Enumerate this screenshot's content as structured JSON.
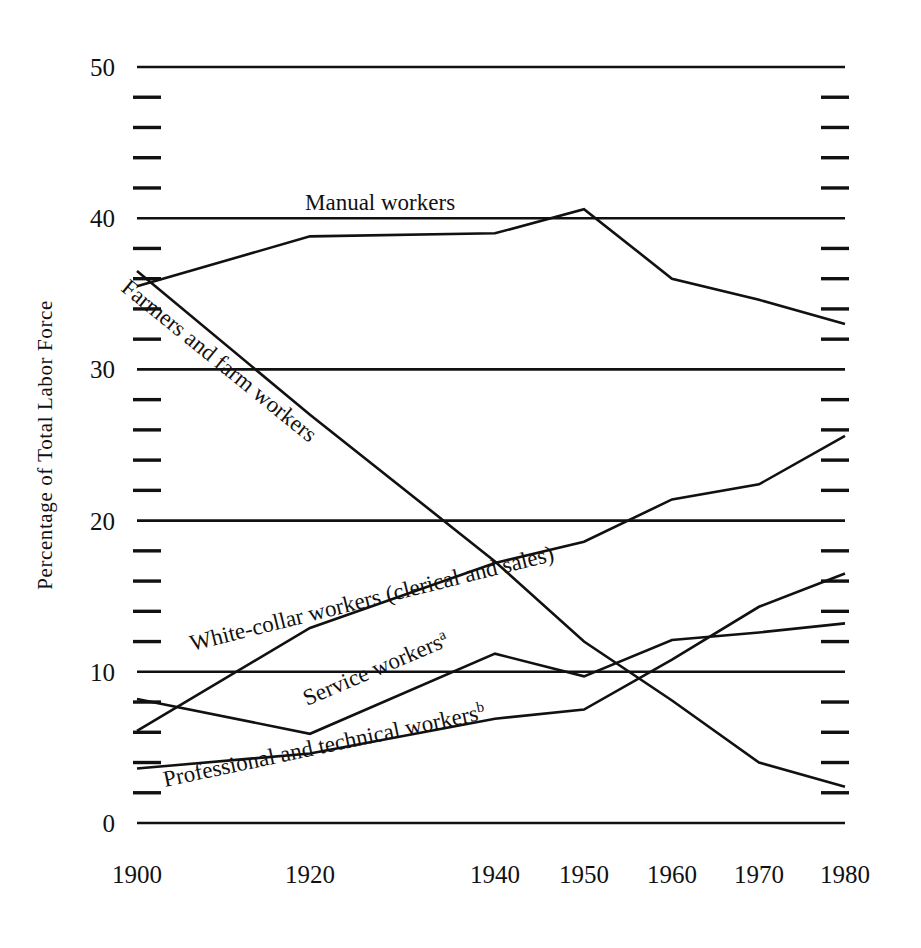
{
  "chart_data": {
    "type": "line",
    "title": "",
    "xlabel": "",
    "ylabel": "Percentage of Total Labor Force",
    "x": [
      1900,
      1920,
      1940,
      1950,
      1960,
      1970,
      1980
    ],
    "xtick_labels": [
      "1900",
      "1920",
      "1940",
      "1950",
      "1960",
      "1970",
      "1980"
    ],
    "ytick_labels": [
      "0",
      "10",
      "20",
      "30",
      "40",
      "50"
    ],
    "ytick_values": [
      0,
      10,
      20,
      30,
      40,
      50
    ],
    "yminor_step": 2,
    "ylim": [
      0,
      50
    ],
    "xlim": [
      1900,
      1980
    ],
    "grid": "major horizontal rules full width; minor ticks at left and right edges",
    "legend": "inline labels drawn along each curve",
    "series": [
      {
        "name": "Manual workers",
        "label": "Manual workers",
        "superscript": "",
        "values": [
          35.5,
          38.8,
          39.0,
          40.6,
          36.0,
          34.6,
          33.0
        ]
      },
      {
        "name": "Farmers and farm workers",
        "label": "Farmers and farm workers",
        "superscript": "",
        "values": [
          36.5,
          27.0,
          17.3,
          12.0,
          8.1,
          4.0,
          2.4
        ]
      },
      {
        "name": "White-collar workers (clerical and sales)",
        "label": "White-collar workers (clerical and sales)",
        "superscript": "",
        "values": [
          6.1,
          12.9,
          17.2,
          18.6,
          21.4,
          22.4,
          25.6
        ]
      },
      {
        "name": "Service workers",
        "label": "Service workers",
        "superscript": "a",
        "values": [
          8.2,
          5.9,
          11.2,
          9.7,
          12.1,
          12.6,
          13.2
        ]
      },
      {
        "name": "Professional and technical workers",
        "label": "Professional and technical workers",
        "superscript": "b",
        "values": [
          3.6,
          4.6,
          6.9,
          7.5,
          10.8,
          14.3,
          16.5
        ]
      }
    ],
    "inline_labels": [
      {
        "key": "manual",
        "text": "Manual workers",
        "sup": "",
        "x": 305,
        "y": 210,
        "rotate": 0
      },
      {
        "key": "farmers",
        "text": "Farmers and farm workers",
        "sup": "",
        "x": 120,
        "y": 290,
        "rotate": 39
      },
      {
        "key": "white",
        "text": "White-collar workers (clerical and sales)",
        "sup": "",
        "x": 192,
        "y": 651,
        "rotate": -14
      },
      {
        "key": "service",
        "text": "Service workers",
        "sup": "a",
        "x": 307,
        "y": 706,
        "rotate": -23
      },
      {
        "key": "professional",
        "text": "Professional and technical workers",
        "sup": "b",
        "x": 165,
        "y": 787,
        "rotate": -12
      }
    ]
  },
  "geometry": {
    "plot_left": 137,
    "plot_right": 845,
    "plot_top": 67,
    "plot_bottom": 823,
    "x_pixels": [
      137,
      310,
      495,
      584,
      672,
      759,
      845
    ]
  }
}
